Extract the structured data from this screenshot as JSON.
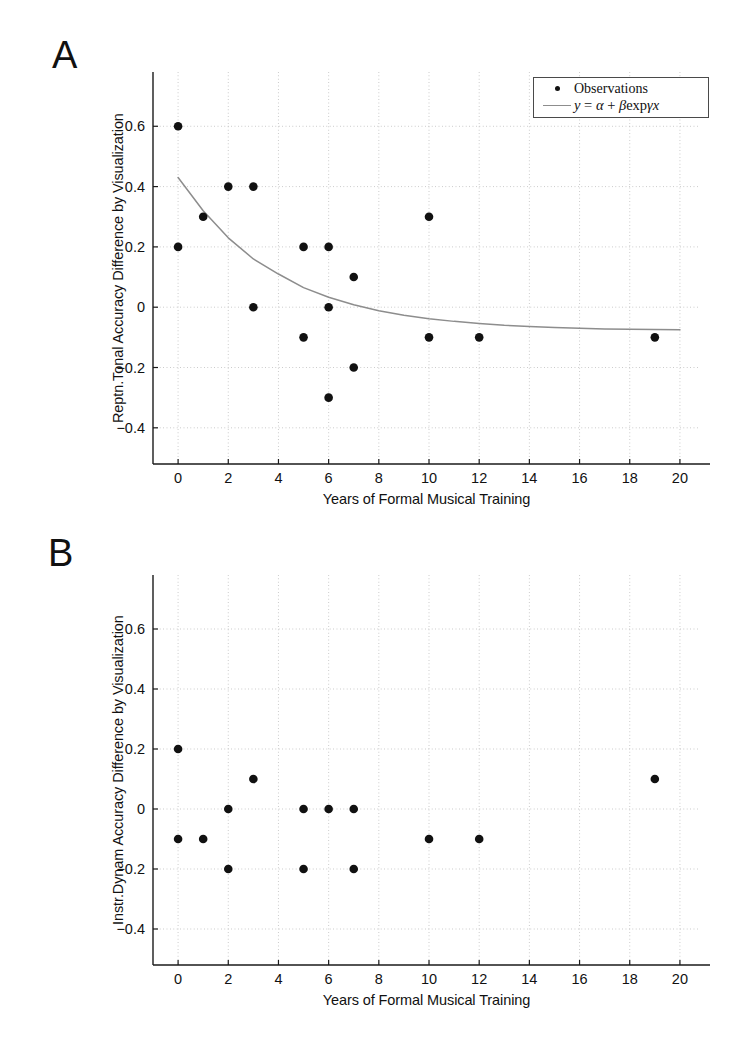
{
  "figure": {
    "panels": [
      {
        "letter": "A",
        "ylabel": "Reptn.Tonal Accuracy Difference by Visualization",
        "xlabel": "Years of Formal Musical Training",
        "legend": {
          "observations_label": "Observations",
          "fit_label_parts": {
            "y": "y",
            "eq": " = ",
            "alpha": "α",
            "plus": " + ",
            "beta": "β",
            "exp": "exp",
            "gamma": "γ",
            "x": "x"
          },
          "fit_label_plain": "y = α + β exp γx"
        }
      },
      {
        "letter": "B",
        "ylabel": "Instr.Dynam Accuracy Difference by Visualization",
        "xlabel": "Years of Formal Musical Training"
      }
    ]
  },
  "chart_data": [
    {
      "type": "scatter",
      "panel": "A",
      "title": "",
      "xlabel": "Years of Formal Musical Training",
      "ylabel": "Reptn.Tonal Accuracy Difference by Visualization",
      "xlim": [
        -1,
        20.8
      ],
      "ylim": [
        -0.52,
        0.78
      ],
      "xticks": [
        0,
        2,
        4,
        6,
        8,
        10,
        12,
        14,
        16,
        18,
        20
      ],
      "xticklabels": [
        "0",
        "2",
        "4",
        "6",
        "8",
        "10",
        "12",
        "14",
        "16",
        "18",
        "20"
      ],
      "yticks": [
        -0.4,
        -0.2,
        0,
        0.2,
        0.4,
        0.6
      ],
      "yticklabels": [
        "−0.4",
        "−0.2",
        "0",
        "0.2",
        "0.4",
        "0.6"
      ],
      "grid": true,
      "grid_style": "dotted",
      "legend_position": "upper-right",
      "series": [
        {
          "name": "Observations",
          "type": "scatter",
          "marker": "circle",
          "color": "#111111",
          "points": [
            [
              0,
              0.6
            ],
            [
              0,
              0.2
            ],
            [
              1,
              0.3
            ],
            [
              2,
              0.4
            ],
            [
              3,
              0.4
            ],
            [
              3,
              0.0
            ],
            [
              5,
              0.2
            ],
            [
              5,
              -0.1
            ],
            [
              6,
              0.2
            ],
            [
              6,
              0.0
            ],
            [
              6,
              -0.3
            ],
            [
              7,
              0.1
            ],
            [
              7,
              -0.2
            ],
            [
              10,
              0.3
            ],
            [
              10,
              -0.1
            ],
            [
              12,
              -0.1
            ],
            [
              19,
              -0.1
            ]
          ]
        },
        {
          "name": "y = α + β exp γx",
          "type": "line",
          "color": "#8d8d8d",
          "curve_params": {
            "alpha": -0.09,
            "beta": 0.52,
            "gamma": -0.24
          },
          "x_range": [
            0,
            20
          ],
          "points": [
            [
              0,
              0.43
            ],
            [
              1,
              0.32
            ],
            [
              2,
              0.23
            ],
            [
              3,
              0.16
            ],
            [
              4,
              0.11
            ],
            [
              5,
              0.065
            ],
            [
              6,
              0.033
            ],
            [
              7,
              0.008
            ],
            [
              8,
              -0.012
            ],
            [
              9,
              -0.027
            ],
            [
              10,
              -0.038
            ],
            [
              11,
              -0.047
            ],
            [
              12,
              -0.054
            ],
            [
              13,
              -0.06
            ],
            [
              14,
              -0.064
            ],
            [
              15,
              -0.067
            ],
            [
              16,
              -0.07
            ],
            [
              17,
              -0.072
            ],
            [
              18,
              -0.073
            ],
            [
              19,
              -0.074
            ],
            [
              20,
              -0.075
            ]
          ]
        }
      ]
    },
    {
      "type": "scatter",
      "panel": "B",
      "title": "",
      "xlabel": "Years of Formal Musical Training",
      "ylabel": "Instr.Dynam Accuracy Difference by Visualization",
      "xlim": [
        -1,
        20.8
      ],
      "ylim": [
        -0.52,
        0.78
      ],
      "xticks": [
        0,
        2,
        4,
        6,
        8,
        10,
        12,
        14,
        16,
        18,
        20
      ],
      "xticklabels": [
        "0",
        "2",
        "4",
        "6",
        "8",
        "10",
        "12",
        "14",
        "16",
        "18",
        "20"
      ],
      "yticks": [
        -0.4,
        -0.2,
        0,
        0.2,
        0.4,
        0.6
      ],
      "yticklabels": [
        "−0.4",
        "−0.2",
        "0",
        "0.2",
        "0.4",
        "0.6"
      ],
      "grid": true,
      "grid_style": "dotted",
      "legend_position": "none",
      "series": [
        {
          "name": "Observations",
          "type": "scatter",
          "marker": "circle",
          "color": "#111111",
          "points": [
            [
              0,
              0.2
            ],
            [
              0,
              -0.1
            ],
            [
              1,
              -0.1
            ],
            [
              2,
              0.0
            ],
            [
              2,
              -0.2
            ],
            [
              3,
              0.1
            ],
            [
              5,
              0.0
            ],
            [
              5,
              -0.2
            ],
            [
              6,
              0.0
            ],
            [
              7,
              0.0
            ],
            [
              7,
              -0.2
            ],
            [
              10,
              -0.1
            ],
            [
              12,
              -0.1
            ],
            [
              19,
              0.1
            ]
          ]
        }
      ]
    }
  ]
}
